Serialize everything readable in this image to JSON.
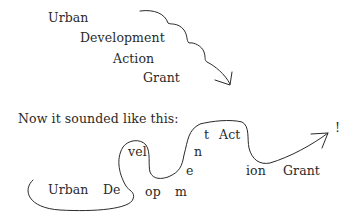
{
  "top_diagram": {
    "words": [
      {
        "text": "Urban",
        "x": 48,
        "y": 12
      },
      {
        "text": "Development",
        "x": 80,
        "y": 32
      },
      {
        "text": "Action",
        "x": 113,
        "y": 53
      },
      {
        "text": "Grant",
        "x": 143,
        "y": 72
      }
    ]
  },
  "caption": "Now it sounded like this:",
  "bottom_diagram": {
    "fragments": [
      {
        "text": "Urban",
        "x": 48,
        "y": 184
      },
      {
        "text": "De",
        "x": 103,
        "y": 184
      },
      {
        "text": "vel",
        "x": 128,
        "y": 146
      },
      {
        "text": "op",
        "x": 145,
        "y": 186
      },
      {
        "text": "m",
        "x": 175,
        "y": 186
      },
      {
        "text": "e",
        "x": 186,
        "y": 165
      },
      {
        "text": "n",
        "x": 194,
        "y": 146
      },
      {
        "text": "t",
        "x": 204,
        "y": 129
      },
      {
        "text": "Act",
        "x": 219,
        "y": 129
      },
      {
        "text": "ion",
        "x": 246,
        "y": 165
      },
      {
        "text": "Grant",
        "x": 283,
        "y": 165
      },
      {
        "text": "!",
        "x": 335,
        "y": 122
      }
    ]
  },
  "colors": {
    "ink": "#2a2a2a",
    "background": "#ffffff"
  }
}
